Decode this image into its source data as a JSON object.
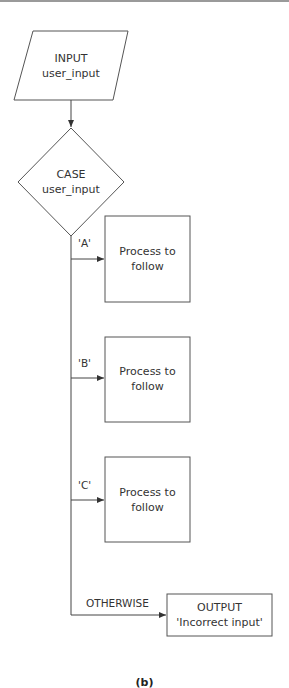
{
  "diagram": {
    "type": "flowchart",
    "caption": "(b)",
    "nodes": {
      "input": {
        "shape": "parallelogram",
        "line1": "INPUT",
        "line2": "user_input"
      },
      "case": {
        "shape": "diamond",
        "line1": "CASE",
        "line2": "user_input"
      },
      "process_a": {
        "shape": "rectangle",
        "line1": "Process to",
        "line2": "follow"
      },
      "process_b": {
        "shape": "rectangle",
        "line1": "Process to",
        "line2": "follow"
      },
      "process_c": {
        "shape": "rectangle",
        "line1": "Process to",
        "line2": "follow"
      },
      "output": {
        "shape": "rectangle",
        "line1": "OUTPUT",
        "line2": "'Incorrect input'"
      }
    },
    "edges": [
      {
        "from": "input",
        "to": "case",
        "label": ""
      },
      {
        "from": "case",
        "to": "process_a",
        "label": "'A'"
      },
      {
        "from": "case",
        "to": "process_b",
        "label": "'B'"
      },
      {
        "from": "case",
        "to": "process_c",
        "label": "'C'"
      },
      {
        "from": "case",
        "to": "output",
        "label": "OTHERWISE"
      }
    ]
  }
}
